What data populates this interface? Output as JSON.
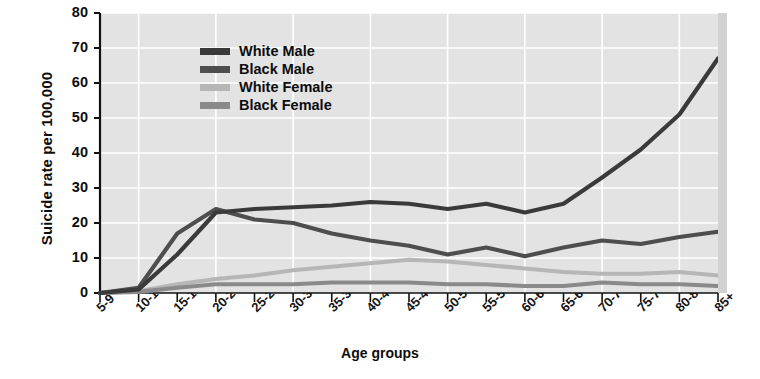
{
  "chart_data": {
    "type": "line",
    "title": "",
    "xlabel": "Age groups",
    "ylabel": "Suicide rate per 100,000",
    "categories": [
      "5-9",
      "10-14",
      "15-19",
      "20-24",
      "25-29",
      "30-34",
      "35-39",
      "40-44",
      "45-49",
      "50-54",
      "55-59",
      "60-64",
      "65-69",
      "70-74",
      "75-79",
      "80-84",
      "85+"
    ],
    "ylim": [
      0,
      80
    ],
    "yticks": [
      0,
      10,
      20,
      30,
      40,
      50,
      60,
      70,
      80
    ],
    "grid": true,
    "legend_position": "upper-left-inside",
    "plot_background": "#e3e3e3",
    "series": [
      {
        "name": "White Male",
        "color": "#3a3a3a",
        "values": [
          0,
          1,
          11,
          23,
          24,
          24.5,
          25,
          26,
          25.5,
          24,
          25.5,
          23,
          25.5,
          33,
          41,
          51,
          67
        ]
      },
      {
        "name": "Black Male",
        "color": "#4e4e4e",
        "values": [
          0,
          1.5,
          17,
          24,
          21,
          20,
          17,
          15,
          13.5,
          11,
          13,
          10.5,
          13,
          15,
          14,
          16,
          17.5
        ]
      },
      {
        "name": "White Female",
        "color": "#b6b6b6",
        "values": [
          0,
          0.5,
          2.5,
          4,
          5,
          6.5,
          7.5,
          8.5,
          9.5,
          9,
          8,
          7,
          6,
          5.5,
          5.5,
          6,
          5
        ]
      },
      {
        "name": "Black Female",
        "color": "#8a8a8a",
        "values": [
          0,
          0.3,
          1.5,
          2.5,
          2.5,
          2.5,
          3,
          3,
          3,
          2.5,
          2.5,
          2,
          2,
          3,
          2.5,
          2.5,
          2
        ]
      }
    ]
  }
}
